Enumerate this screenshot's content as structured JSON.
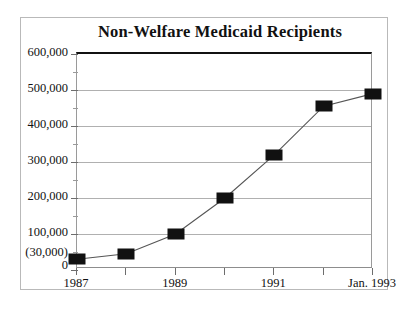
{
  "figure": {
    "title": "Non-Welfare Medicaid Recipients",
    "border_color": "#b9b9b9",
    "gridline_color": "#b0b0b0",
    "series_color": "#111111"
  },
  "chart_data": {
    "type": "line",
    "title": "Non-Welfare Medicaid Recipients",
    "xlabel": "",
    "ylabel": "",
    "grid": true,
    "legend": false,
    "ylim": [
      0,
      600000
    ],
    "yticks": [
      0,
      100000,
      200000,
      300000,
      400000,
      500000,
      600000
    ],
    "ytick_labels": [
      "0",
      "100,000",
      "200,000",
      "300,000",
      "400,000",
      "500,000",
      "600,000"
    ],
    "y_special_label": "(30,000)",
    "y_special_value": 30000,
    "y_minor_tick_interval": 50000,
    "x_tick_labels": [
      "1987",
      "",
      "1989",
      "",
      "1991",
      "",
      "Jan. 1993"
    ],
    "x_visible_labels": [
      "1987",
      "1989",
      "1991",
      "Jan. 1993"
    ],
    "categories": [
      "1987",
      "1988",
      "1989",
      "1990",
      "1991",
      "1992",
      "Jan. 1993"
    ],
    "values": [
      30000,
      45000,
      100000,
      200000,
      320000,
      455000,
      490000
    ],
    "marker": "square",
    "marker_color": "#111111",
    "line_color": "#555555"
  },
  "axis": {
    "y_labels": [
      {
        "text": "600,000",
        "value": 600000
      },
      {
        "text": "500,000",
        "value": 500000
      },
      {
        "text": "400,000",
        "value": 400000
      },
      {
        "text": "300,000",
        "value": 300000
      },
      {
        "text": "200,000",
        "value": 200000
      },
      {
        "text": "100,000",
        "value": 100000
      },
      {
        "text": "(30,000)",
        "value": 30000
      },
      {
        "text": "0",
        "value": 0
      }
    ],
    "x_labels": [
      {
        "text": "1987",
        "index": 0
      },
      {
        "text": "1989",
        "index": 2
      },
      {
        "text": "1991",
        "index": 4
      },
      {
        "text": "Jan. 1993",
        "index": 6
      }
    ]
  }
}
